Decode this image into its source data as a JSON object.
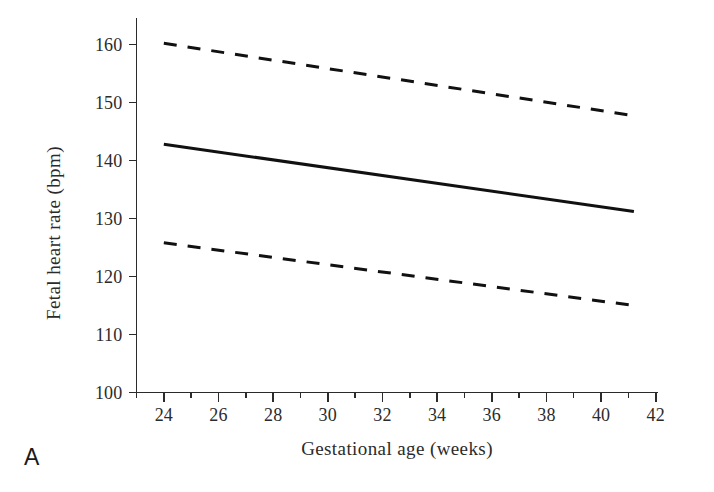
{
  "panel": {
    "label": "A"
  },
  "chart_data": {
    "type": "line",
    "title": "",
    "subtitle": "",
    "xlabel": "Gestational age (weeks)",
    "ylabel": "Fetal heart rate (bpm)",
    "xlim": [
      23,
      42
    ],
    "ylim": [
      100,
      165
    ],
    "xticks": [
      24,
      26,
      28,
      30,
      32,
      34,
      36,
      38,
      40,
      42
    ],
    "xtick_labels": [
      "24",
      "26",
      "28",
      "30",
      "32",
      "34",
      "36",
      "38",
      "40",
      "42"
    ],
    "xtick_minor_step": 1,
    "yticks": [
      100,
      110,
      120,
      130,
      140,
      150,
      160
    ],
    "ytick_labels": [
      "100",
      "110",
      "120",
      "130",
      "140",
      "150",
      "160"
    ],
    "grid": false,
    "legend": "none",
    "series": [
      {
        "name": "95% CI upper limit",
        "style": "dashed",
        "color": "#111111",
        "x": [
          24.0,
          41.1
        ],
        "values": [
          160.2,
          147.8
        ]
      },
      {
        "name": "Mean fetal heart rate",
        "style": "solid",
        "color": "#111111",
        "x": [
          24.0,
          41.2
        ],
        "values": [
          142.8,
          131.2
        ]
      },
      {
        "name": "95% CI lower limit",
        "style": "dashed",
        "color": "#111111",
        "x": [
          24.0,
          41.2
        ],
        "values": [
          125.8,
          115.0
        ]
      }
    ],
    "annotations": []
  },
  "colors": {
    "background": "#ffffff",
    "ink": "#2b2b2b",
    "line": "#111111"
  }
}
